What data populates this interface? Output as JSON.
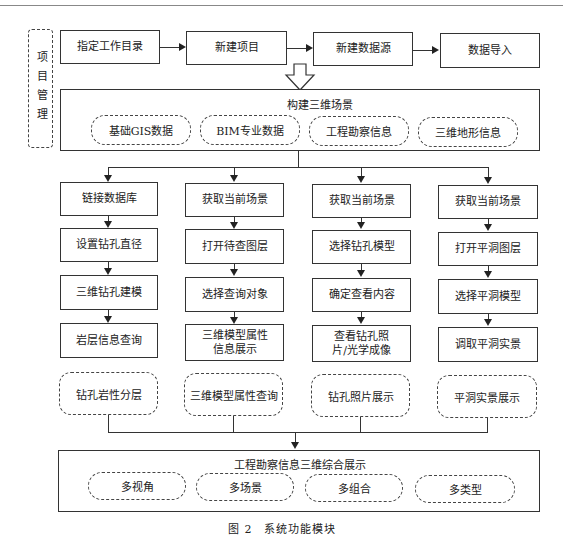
{
  "side_label": "项目管理",
  "top_flow": [
    "指定工作目录",
    "新建项目",
    "新建数据源",
    "数据导入"
  ],
  "build_scene": {
    "title": "构建三维场景",
    "items": [
      "基础GIS数据",
      "BIM专业数据",
      "工程勘察信息",
      "三维地形信息"
    ]
  },
  "columns": [
    {
      "steps": [
        "链接数据库",
        "设置钻孔直径",
        "三维钻孔建模",
        "岩层信息查询"
      ],
      "result": "钻孔岩性分层"
    },
    {
      "steps": [
        "获取当前场景",
        "打开待查图层",
        "选择查询对象",
        "三维模型属性信息展示"
      ],
      "result": "三维模型属性查询"
    },
    {
      "steps": [
        "获取当前场景",
        "选择钻孔模型",
        "确定查看内容",
        "查看钻孔照片/光学成像"
      ],
      "result": "钻孔照片展示"
    },
    {
      "steps": [
        "获取当前场景",
        "打开平洞图层",
        "选择平洞模型",
        "调取平洞实景"
      ],
      "result": "平洞实景展示"
    }
  ],
  "final": {
    "title": "工程勘察信息三维综合展示",
    "items": [
      "多视角",
      "多场景",
      "多组合",
      "多类型"
    ]
  },
  "caption": "图 2　系统功能模块"
}
